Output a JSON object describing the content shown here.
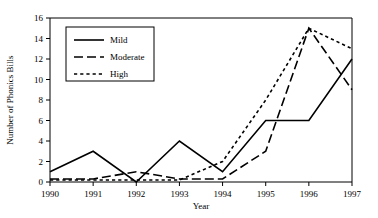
{
  "chart_data": {
    "type": "line",
    "title": "",
    "xlabel": "Year",
    "ylabel": "Number of Phonics Bills",
    "categories": [
      "1990",
      "1991",
      "1992",
      "1993",
      "1994",
      "1995",
      "1996",
      "1997"
    ],
    "x": [
      1990,
      1991,
      1992,
      1993,
      1994,
      1995,
      1996,
      1997
    ],
    "xlim": [
      1990,
      1997
    ],
    "ylim": [
      0,
      16
    ],
    "yticks": [
      0,
      2,
      4,
      6,
      8,
      10,
      12,
      14,
      16
    ],
    "ytick_labels": [
      "0",
      "2",
      "4",
      "6",
      "8",
      "10",
      "12",
      "14",
      "16"
    ],
    "xtick_labels": [
      "1990",
      "1991",
      "1992",
      "1993",
      "1994",
      "1995",
      "1996",
      "1997"
    ],
    "grid": false,
    "legend_position": "upper left",
    "series": [
      {
        "name": "Mild",
        "style": "solid",
        "values": [
          1,
          3,
          0,
          4,
          1,
          6,
          6,
          12
        ]
      },
      {
        "name": "Moderate",
        "style": "long-dash",
        "values": [
          0.3,
          0.3,
          1,
          0.3,
          0.3,
          3,
          15,
          9
        ]
      },
      {
        "name": "High",
        "style": "short-dash",
        "values": [
          0.2,
          0.2,
          0.2,
          0.2,
          2,
          8,
          15,
          13
        ]
      }
    ]
  },
  "legend": {
    "entries": [
      {
        "label": "Mild"
      },
      {
        "label": "Moderate"
      },
      {
        "label": "High"
      }
    ]
  }
}
